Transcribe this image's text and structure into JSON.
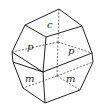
{
  "diagram": {
    "type": "crystal-form",
    "face_labels": {
      "top": "c",
      "upper_front": "p",
      "upper_back": "p",
      "lower_front": "m",
      "lower_back": "m"
    },
    "colors": {
      "edge": "#222222",
      "hidden_edge": "#444444",
      "background": "#ffffff"
    }
  }
}
